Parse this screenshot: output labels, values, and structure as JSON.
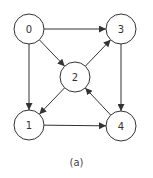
{
  "diagram": {
    "type": "directed-graph",
    "caption": "(a)",
    "colors": {
      "stroke": "#333333",
      "fill": "#ffffff",
      "text": "#333333"
    },
    "node_radius": 15,
    "nodes": [
      {
        "id": "0",
        "label": "0",
        "x": 29,
        "y": 29
      },
      {
        "id": "1",
        "label": "1",
        "x": 29,
        "y": 125
      },
      {
        "id": "2",
        "label": "2",
        "x": 75,
        "y": 77
      },
      {
        "id": "3",
        "label": "3",
        "x": 121,
        "y": 29
      },
      {
        "id": "4",
        "label": "4",
        "x": 121,
        "y": 126
      }
    ],
    "edges": [
      {
        "from": "0",
        "to": "3"
      },
      {
        "from": "0",
        "to": "2"
      },
      {
        "from": "0",
        "to": "1"
      },
      {
        "from": "2",
        "to": "3"
      },
      {
        "from": "2",
        "to": "1"
      },
      {
        "from": "3",
        "to": "4"
      },
      {
        "from": "4",
        "to": "2"
      },
      {
        "from": "1",
        "to": "4"
      }
    ]
  }
}
